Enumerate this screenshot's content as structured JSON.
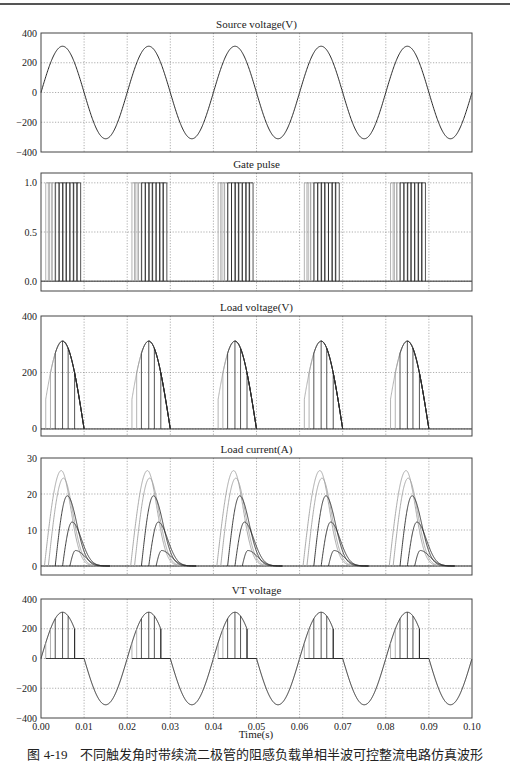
{
  "figure": {
    "caption_number": "图 4-19",
    "caption_text": "不同触发角时带续流二极管的阻感负载单相半波可控整流电路仿真波形",
    "xlabel": "Time(s)"
  },
  "colors": {
    "axis": "#444444",
    "grid": "#777777",
    "trace_dark": "#2a2a2a",
    "trace_mid": "#555555",
    "trace_light": "#a0a0a0"
  },
  "chart_data": [
    {
      "type": "line",
      "title": "Source voltage(V)",
      "xlabel": "",
      "ylabel": "",
      "xlim": [
        0,
        0.1
      ],
      "ylim": [
        -400,
        400
      ],
      "yticks": [
        400,
        200,
        0,
        -200,
        -400
      ],
      "ytick_labels": [
        "400",
        "200",
        "0",
        "−200",
        "−400"
      ],
      "grid": true,
      "series": [
        {
          "name": "u2",
          "formula": "311*sin(2*pi*50*t)",
          "amplitude": 311,
          "frequency_hz": 50
        }
      ]
    },
    {
      "type": "line",
      "title": "Gate pulse",
      "xlim": [
        0,
        0.1
      ],
      "ylim": [
        -0.1,
        1.1
      ],
      "yticks": [
        1.0,
        0.5,
        0.0
      ],
      "ytick_labels": [
        "1.0",
        "0.5",
        "0.0"
      ],
      "grid": true,
      "pulse_delays_s": [
        0.0011,
        0.0017,
        0.0025,
        0.0033,
        0.0042,
        0.005,
        0.0058,
        0.0067,
        0.0075,
        0.0083
      ],
      "pulse_width_s": 0.0009,
      "period_s": 0.02
    },
    {
      "type": "line",
      "title": "Load voltage(V)",
      "xlim": [
        0,
        0.1
      ],
      "ylim": [
        -25,
        400
      ],
      "yticks": [
        400,
        200,
        0
      ],
      "ytick_labels": [
        "400",
        "200",
        "0"
      ],
      "grid": true,
      "firing_delays_s": [
        0.0011,
        0.0022,
        0.0033,
        0.005,
        0.0063,
        0.0078
      ],
      "period_s": 0.02
    },
    {
      "type": "line",
      "title": "Load current(A)",
      "xlim": [
        0,
        0.1
      ],
      "ylim": [
        -2.5,
        30
      ],
      "yticks": [
        30,
        20,
        10,
        0
      ],
      "ytick_labels": [
        "30",
        "20",
        "10",
        "0"
      ],
      "grid": true,
      "series": [
        {
          "name": "alpha1",
          "start_s": 0.0008,
          "peak_A": 26.5,
          "peak_s": 0.0047
        },
        {
          "name": "alpha2",
          "start_s": 0.0017,
          "peak_A": 24.4,
          "peak_s": 0.0052
        },
        {
          "name": "alpha3",
          "start_s": 0.0033,
          "peak_A": 19.5,
          "peak_s": 0.0061
        },
        {
          "name": "alpha4",
          "start_s": 0.005,
          "peak_A": 12.2,
          "peak_s": 0.0072
        },
        {
          "name": "alpha5",
          "start_s": 0.0067,
          "peak_A": 4.3,
          "peak_s": 0.008
        }
      ],
      "decay_end_s": 0.016,
      "period_s": 0.02
    },
    {
      "type": "line",
      "title": "VT voltage",
      "xlabel": "Time(s)",
      "xlim": [
        0,
        0.1
      ],
      "ylim": [
        -400,
        400
      ],
      "xticks": [
        0.0,
        0.01,
        0.02,
        0.03,
        0.04,
        0.05,
        0.06,
        0.07,
        0.08,
        0.09,
        0.1
      ],
      "xtick_labels": [
        "0.00",
        "0.01",
        "0.02",
        "0.03",
        "0.04",
        "0.05",
        "0.06",
        "0.07",
        "0.08",
        "0.09",
        "0.10"
      ],
      "yticks": [
        400,
        200,
        0,
        -200,
        -400
      ],
      "ytick_labels": [
        "400",
        "200",
        "0",
        "−200",
        "−400"
      ],
      "grid": true,
      "firing_delays_s": [
        0.0011,
        0.0022,
        0.0033,
        0.005,
        0.0063,
        0.0078
      ],
      "period_s": 0.02
    }
  ]
}
